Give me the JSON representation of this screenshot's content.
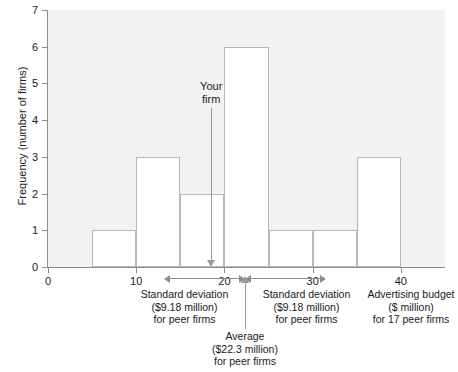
{
  "chart_data": {
    "type": "bar",
    "title": "",
    "subtitle": "",
    "xlabel": "Advertising budget ($ million) for 17 peer firms",
    "ylabel": "Frequency (number of firms)",
    "xlim": [
      0,
      45
    ],
    "ylim": [
      0,
      7
    ],
    "grid": false,
    "legend": "none",
    "bin_width": 5,
    "bin_edges": [
      0,
      5,
      10,
      15,
      20,
      25,
      30,
      35,
      40,
      45
    ],
    "categories": [
      "0-5",
      "5-10",
      "10-15",
      "15-20",
      "20-25",
      "25-30",
      "30-35",
      "35-40",
      "40-45"
    ],
    "values": [
      0,
      1,
      3,
      2,
      6,
      1,
      1,
      3,
      0
    ],
    "xticks": [
      0,
      10,
      20,
      30,
      40
    ],
    "yticks": [
      0,
      1,
      2,
      3,
      4,
      5,
      6,
      7
    ],
    "annotations": [
      {
        "name": "your-firm",
        "label": "Your firm",
        "x": 18.5,
        "type": "down-arrow"
      },
      {
        "name": "average",
        "label": "Average ($22.3 million) for peer firms",
        "x": 22.3,
        "type": "up-arrow"
      },
      {
        "name": "std-dev-left",
        "label": "Standard deviation ($9.18 million) for peer firms",
        "from": 13.12,
        "to": 22.3,
        "type": "span"
      },
      {
        "name": "std-dev-right",
        "label": "Standard deviation ($9.18 million) for peer firms",
        "from": 22.3,
        "to": 31.48,
        "type": "span"
      }
    ],
    "colors": {
      "plot_background": "#f2f2f2",
      "bar_fill": "#ffffff",
      "bar_edge": "#b8b8b8",
      "axis": "#8c8c8c",
      "text": "#1a1a1a",
      "pointer": "#9a9a9a"
    }
  },
  "axes": {
    "y_label": "Frequency (number of firms)",
    "y_ticks": [
      "0",
      "1",
      "2",
      "3",
      "4",
      "5",
      "6",
      "7"
    ],
    "x_ticks": [
      "0",
      "10",
      "20",
      "30",
      "40"
    ]
  },
  "annotations": {
    "your_firm": {
      "line1": "Your",
      "line2": "firm"
    },
    "std_dev_left": {
      "line1": "Standard deviation",
      "line2": "($9.18 million)",
      "line3": "for peer firms"
    },
    "std_dev_right": {
      "line1": "Standard deviation",
      "line2": "($9.18 million)",
      "line3": "for peer firms"
    },
    "average": {
      "line1": "Average",
      "line2": "($22.3 million)",
      "line3": "for peer firms"
    },
    "x_axis_caption": {
      "line1": "Advertising budget",
      "line2": "($ million)",
      "line3": "for 17 peer firms"
    }
  }
}
